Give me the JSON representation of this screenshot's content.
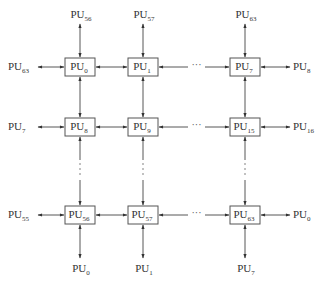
{
  "diagram": {
    "title": "",
    "label_prefix": "PU",
    "columns": [
      {
        "x": 80,
        "name": "col-0"
      },
      {
        "x": 143,
        "name": "col-1"
      },
      {
        "x": 245,
        "name": "col-7"
      }
    ],
    "rows": [
      {
        "y": 67,
        "name": "row-0"
      },
      {
        "y": 127,
        "name": "row-1"
      },
      {
        "y": 215,
        "name": "row-7"
      }
    ],
    "nodes": [
      {
        "id": "0",
        "row": 0,
        "col": 0
      },
      {
        "id": "1",
        "row": 0,
        "col": 1
      },
      {
        "id": "7",
        "row": 0,
        "col": 2
      },
      {
        "id": "8",
        "row": 1,
        "col": 0
      },
      {
        "id": "9",
        "row": 1,
        "col": 1
      },
      {
        "id": "15",
        "row": 1,
        "col": 2
      },
      {
        "id": "56",
        "row": 2,
        "col": 0
      },
      {
        "id": "57",
        "row": 2,
        "col": 1
      },
      {
        "id": "63",
        "row": 2,
        "col": 2
      }
    ],
    "top_labels": [
      {
        "col": 0,
        "sub": "56"
      },
      {
        "col": 1,
        "sub": "57"
      },
      {
        "col": 2,
        "sub": "63"
      }
    ],
    "bottom_labels": [
      {
        "col": 0,
        "sub": "0"
      },
      {
        "col": 1,
        "sub": "1"
      },
      {
        "col": 2,
        "sub": "7"
      }
    ],
    "left_labels": [
      {
        "row": 0,
        "sub": "63"
      },
      {
        "row": 1,
        "sub": "7"
      },
      {
        "row": 2,
        "sub": "55"
      }
    ],
    "right_labels": [
      {
        "row": 0,
        "sub": "8"
      },
      {
        "row": 1,
        "sub": "16"
      },
      {
        "row": 2,
        "sub": "0"
      }
    ],
    "horizontal_ellipsis": "···",
    "vertical_ellipsis": "⋮",
    "colors": {
      "line": "#444444",
      "box_stroke": "#555555",
      "text": "#333333"
    }
  }
}
